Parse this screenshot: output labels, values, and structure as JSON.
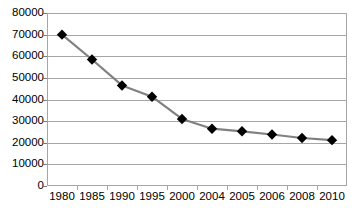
{
  "chart_data": {
    "type": "line",
    "title": "",
    "subtitle": "",
    "xlabel": "",
    "ylabel": "",
    "categories": [
      "1980",
      "1985",
      "1990",
      "1995",
      "2000",
      "2004",
      "2005",
      "2006",
      "2008",
      "2010"
    ],
    "values": [
      70000,
      58500,
      46500,
      41300,
      31000,
      26500,
      25300,
      23800,
      22200,
      21200
    ],
    "series": [
      {
        "name": "",
        "values": [
          70000,
          58500,
          46500,
          41300,
          31000,
          26500,
          25300,
          23800,
          22200,
          21200
        ]
      }
    ],
    "ylim": [
      0,
      80000
    ],
    "yticks": [
      0,
      10000,
      20000,
      30000,
      40000,
      50000,
      60000,
      70000,
      80000
    ],
    "ytick_labels": [
      "0",
      "10000",
      "20000",
      "30000",
      "40000",
      "50000",
      "60000",
      "70000",
      "80000"
    ],
    "grid": true,
    "grid_axis": "y",
    "legend": false,
    "legend_position": "none",
    "marker": "diamond",
    "marker_color": "#000000",
    "line_color": "#808080",
    "plot_border_color": "#a6a6a6",
    "background_color": "#ffffff",
    "annotations": []
  }
}
